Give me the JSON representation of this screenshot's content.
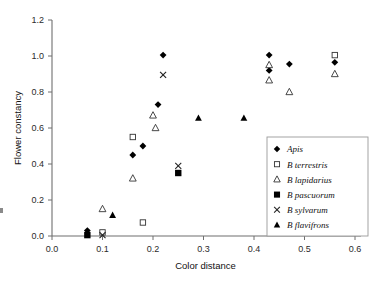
{
  "chart_data": {
    "type": "scatter",
    "title": "",
    "xlabel": "Color distance",
    "ylabel": "Flower constancy",
    "xlim": [
      0.0,
      0.6
    ],
    "ylim": [
      0.0,
      1.2
    ],
    "xticks": [
      "0.0",
      "0.1",
      "0.2",
      "0.3",
      "0.4",
      "0.5",
      "0.6"
    ],
    "yticks": [
      "0.0",
      "0.2",
      "0.4",
      "0.6",
      "0.8",
      "1.0",
      "1.2"
    ],
    "xtick_values": [
      0.0,
      0.1,
      0.2,
      0.3,
      0.4,
      0.5,
      0.6
    ],
    "ytick_values": [
      0.0,
      0.2,
      0.4,
      0.6,
      0.8,
      1.0,
      1.2
    ],
    "grid": false,
    "legend_position": "right-middle",
    "series": [
      {
        "name": "Apis",
        "marker": "filled-diamond",
        "color": "#000000",
        "points": [
          {
            "x": 0.07,
            "y": 0.03
          },
          {
            "x": 0.16,
            "y": 0.45
          },
          {
            "x": 0.18,
            "y": 0.5
          },
          {
            "x": 0.21,
            "y": 0.73
          },
          {
            "x": 0.22,
            "y": 1.005
          },
          {
            "x": 0.43,
            "y": 1.005
          },
          {
            "x": 0.43,
            "y": 0.92
          },
          {
            "x": 0.47,
            "y": 0.955
          },
          {
            "x": 0.56,
            "y": 0.965
          }
        ]
      },
      {
        "name": "B terrestris",
        "marker": "open-square",
        "color": "#333333",
        "points": [
          {
            "x": 0.1,
            "y": 0.02
          },
          {
            "x": 0.18,
            "y": 0.075
          },
          {
            "x": 0.16,
            "y": 0.55
          },
          {
            "x": 0.56,
            "y": 1.005
          }
        ]
      },
      {
        "name": "B lapidarius",
        "marker": "open-triangle",
        "color": "#333333",
        "points": [
          {
            "x": 0.1,
            "y": 0.15
          },
          {
            "x": 0.16,
            "y": 0.32
          },
          {
            "x": 0.205,
            "y": 0.6
          },
          {
            "x": 0.2,
            "y": 0.67
          },
          {
            "x": 0.43,
            "y": 0.95
          },
          {
            "x": 0.43,
            "y": 0.865
          },
          {
            "x": 0.47,
            "y": 0.8
          },
          {
            "x": 0.56,
            "y": 0.9
          }
        ]
      },
      {
        "name": "B pascuorum",
        "marker": "filled-square",
        "color": "#000000",
        "points": [
          {
            "x": 0.07,
            "y": 0.005
          },
          {
            "x": 0.25,
            "y": 0.35
          }
        ]
      },
      {
        "name": "B sylvarum",
        "marker": "cross-x",
        "color": "#222222",
        "points": [
          {
            "x": 0.1,
            "y": 0.005
          },
          {
            "x": 0.22,
            "y": 0.895
          },
          {
            "x": 0.25,
            "y": 0.39
          }
        ]
      },
      {
        "name": "B flavifrons",
        "marker": "filled-triangle",
        "color": "#000000",
        "points": [
          {
            "x": 0.12,
            "y": 0.115
          },
          {
            "x": 0.29,
            "y": 0.655
          },
          {
            "x": 0.38,
            "y": 0.655
          }
        ]
      }
    ]
  },
  "legend": {
    "entries": [
      {
        "label": "Apis",
        "marker": "filled-diamond"
      },
      {
        "label": "B terrestris",
        "marker": "open-square"
      },
      {
        "label": "B lapidarius",
        "marker": "open-triangle"
      },
      {
        "label": "B pascuorum",
        "marker": "filled-square"
      },
      {
        "label": "B sylvarum",
        "marker": "cross-x"
      },
      {
        "label": "B flavifrons",
        "marker": "filled-triangle"
      }
    ]
  }
}
